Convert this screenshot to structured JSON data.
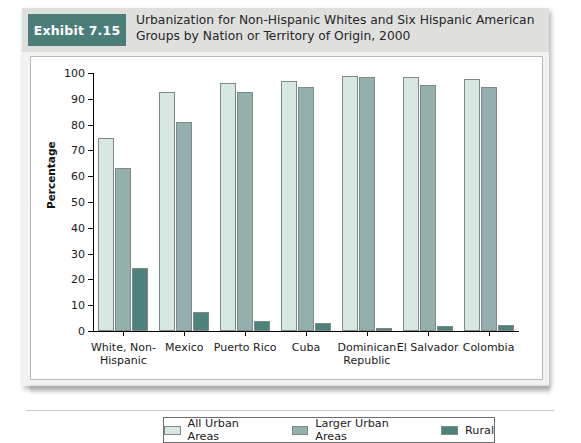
{
  "header": {
    "exhibit_tag": "Exhibit 7.15",
    "title": "Urbanization for Non-Hispanic Whites and Six Hispanic American Groups by Nation or Territory of Origin, 2000"
  },
  "colors": {
    "tag_bg": "#4c7e79",
    "header_bg": "#dfe0de",
    "series_all_urban": "#d7e8e2",
    "series_larger_urban": "#93b0ad",
    "series_rural": "#4e837d"
  },
  "legend": {
    "items": [
      {
        "label": "All Urban Areas",
        "color": "#d7e8e2"
      },
      {
        "label": "Larger Urban Areas",
        "color": "#93b0ad"
      },
      {
        "label": "Rural",
        "color": "#4e837d"
      }
    ]
  },
  "chart_data": {
    "type": "bar",
    "title": "Urbanization for Non-Hispanic Whites and Six Hispanic American Groups by Nation or Territory of Origin, 2000",
    "xlabel": "",
    "ylabel": "Percentage",
    "ylim": [
      0,
      100
    ],
    "yticks": [
      0,
      10,
      20,
      30,
      40,
      50,
      60,
      70,
      80,
      90,
      100
    ],
    "grid": false,
    "legend_position": "bottom",
    "categories": [
      "White, Non-Hispanic",
      "Mexico",
      "Puerto Rico",
      "Cuba",
      "Dominican Republic",
      "El Salvador",
      "Colombia"
    ],
    "category_lines": [
      [
        "White, Non-",
        "Hispanic"
      ],
      [
        "Mexico"
      ],
      [
        "Puerto Rico"
      ],
      [
        "Cuba"
      ],
      [
        "Dominican",
        "Republic"
      ],
      [
        "El Salvador"
      ],
      [
        "Colombia"
      ]
    ],
    "series": [
      {
        "name": "All Urban Areas",
        "color": "#d7e8e2",
        "values": [
          75,
          92.5,
          96,
          97,
          99,
          98.5,
          97.5
        ]
      },
      {
        "name": "Larger Urban Areas",
        "color": "#93b0ad",
        "values": [
          63,
          81,
          92.5,
          94.5,
          98.5,
          95.5,
          94.5
        ]
      },
      {
        "name": "Rural",
        "color": "#4e837d",
        "values": [
          24.5,
          7.5,
          4,
          3,
          1,
          2,
          2.5
        ]
      }
    ]
  }
}
